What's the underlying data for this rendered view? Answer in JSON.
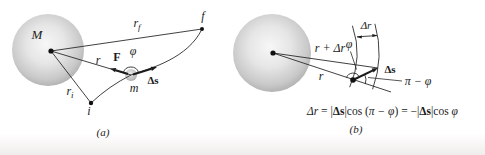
{
  "figure_type": "physics-diagram-gravitational-work",
  "panel_a": {
    "caption": "(a)",
    "labels": {
      "mass": "M",
      "r_f": {
        "main": "r",
        "sub": "f"
      },
      "point_f": "f",
      "r": "r",
      "force": "F",
      "phi": "φ",
      "delta_s": "Δs",
      "particle": "m",
      "r_i": {
        "main": "r",
        "sub": "i"
      },
      "point_i": "i"
    }
  },
  "panel_b": {
    "caption": "(b)",
    "labels": {
      "r_plus_dr": "r + Δr",
      "phi": "φ",
      "r": "r",
      "delta_r": "Δr",
      "delta_s": "Δs",
      "pi_minus_phi": "π − φ"
    },
    "equation": {
      "parts": [
        {
          "t": "Δr"
        },
        {
          "t": " = |"
        },
        {
          "t": "Δs"
        },
        {
          "t": "|cos ("
        },
        {
          "t": "π − φ"
        },
        {
          "t": ") = −|"
        },
        {
          "t": "Δs"
        },
        {
          "t": "|cos "
        },
        {
          "t": "φ"
        }
      ]
    }
  },
  "colors": {
    "line": "#2b2b2b",
    "text": "#1b1b1b",
    "sphere_highlight": "#f7f7f7",
    "sphere_mid": "#c9c9c9",
    "sphere_edge": "#8d8d8d",
    "background": "#ffffff"
  }
}
